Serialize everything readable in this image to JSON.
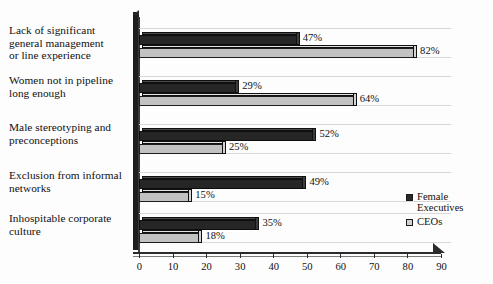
{
  "chart_data": {
    "type": "bar",
    "orientation": "horizontal",
    "title": "",
    "subtitle": "",
    "xlabel": "",
    "ylabel": "",
    "xlim": [
      0,
      95
    ],
    "grid": true,
    "legend_position": "right-bottom",
    "categories": [
      "Lack of significant general management or line experience",
      "Women not in pipeline long enough",
      "Male stereotyping and preconceptions",
      "Exclusion from informal networks",
      "Inhospitable corporate culture"
    ],
    "category_lines": [
      [
        "Lack of significant",
        "general management",
        "or line experience"
      ],
      [
        "Women not in pipeline",
        "long enough"
      ],
      [
        "Male stereotyping and",
        "preconceptions"
      ],
      [
        "Exclusion from informal",
        "networks"
      ],
      [
        "Inhospitable corporate",
        "culture"
      ]
    ],
    "series": [
      {
        "name": "Female Executives",
        "color": "#262626",
        "values": [
          47,
          29,
          52,
          49,
          35
        ],
        "labels": [
          "47%",
          "29%",
          "52%",
          "49%",
          "35%"
        ]
      },
      {
        "name": "CEOs",
        "color": "#c2c2c2",
        "values": [
          82,
          64,
          25,
          15,
          18
        ],
        "labels": [
          "82%",
          "64%",
          "25%",
          "15%",
          "18%"
        ]
      }
    ],
    "x_ticks": [
      0,
      10,
      20,
      30,
      40,
      50,
      60,
      70,
      80,
      90
    ],
    "x_tick_labels": [
      "0",
      "10",
      "20",
      "30",
      "40",
      "50",
      "60",
      "70",
      "80",
      "90"
    ]
  },
  "legend": {
    "items": [
      {
        "label_line1": "Female",
        "label_line2": "Executives",
        "swatch": "dark"
      },
      {
        "label_line1": "CEOs",
        "label_line2": "",
        "swatch": "light"
      }
    ]
  }
}
